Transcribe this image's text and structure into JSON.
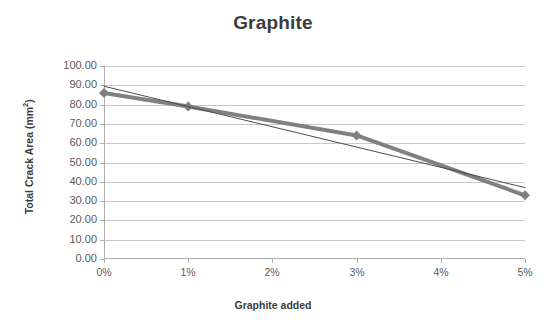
{
  "chart_data": {
    "type": "line",
    "title": "Graphite",
    "xlabel": "Graphite added",
    "ylabel": "Total Crack Area (mm2)",
    "ylabel_base": "Total Crack Area (mm",
    "ylabel_sup": "2",
    "ylabel_tail": ")",
    "x_tick_labels": [
      "0%",
      "1%",
      "2%",
      "3%",
      "4%",
      "5%"
    ],
    "x_tick_values": [
      0,
      1,
      2,
      3,
      4,
      5
    ],
    "y_tick_labels": [
      "100.00",
      "90.00",
      "80.00",
      "70.00",
      "60.00",
      "50.00",
      "40.00",
      "30.00",
      "20.00",
      "10.00",
      "0.00"
    ],
    "y_tick_values": [
      100,
      90,
      80,
      70,
      60,
      50,
      40,
      30,
      20,
      10,
      0
    ],
    "xlim": [
      0,
      5
    ],
    "ylim": [
      0,
      100
    ],
    "grid": true,
    "grid_axis": "y",
    "legend": false,
    "series": [
      {
        "name": "Total Crack Area",
        "style": "line-with-markers",
        "color": "#808080",
        "marker": "diamond",
        "line_width": 4,
        "x": [
          0,
          1,
          3,
          5
        ],
        "values": [
          86.0,
          79.0,
          64.0,
          33.0
        ]
      },
      {
        "name": "Linear trendline",
        "style": "thin-line",
        "color": "#4d4d4d",
        "marker": "none",
        "line_width": 1,
        "x": [
          0,
          5
        ],
        "values": [
          89.5,
          37.0
        ]
      }
    ]
  },
  "colors": {
    "series": "#808080",
    "trendline": "#4d4d4d",
    "gridline": "#c9c9c9",
    "axis": "#b0b0b0",
    "text": "#3b3b3b",
    "tick_text": "#5a5a5a",
    "background": "#ffffff"
  }
}
